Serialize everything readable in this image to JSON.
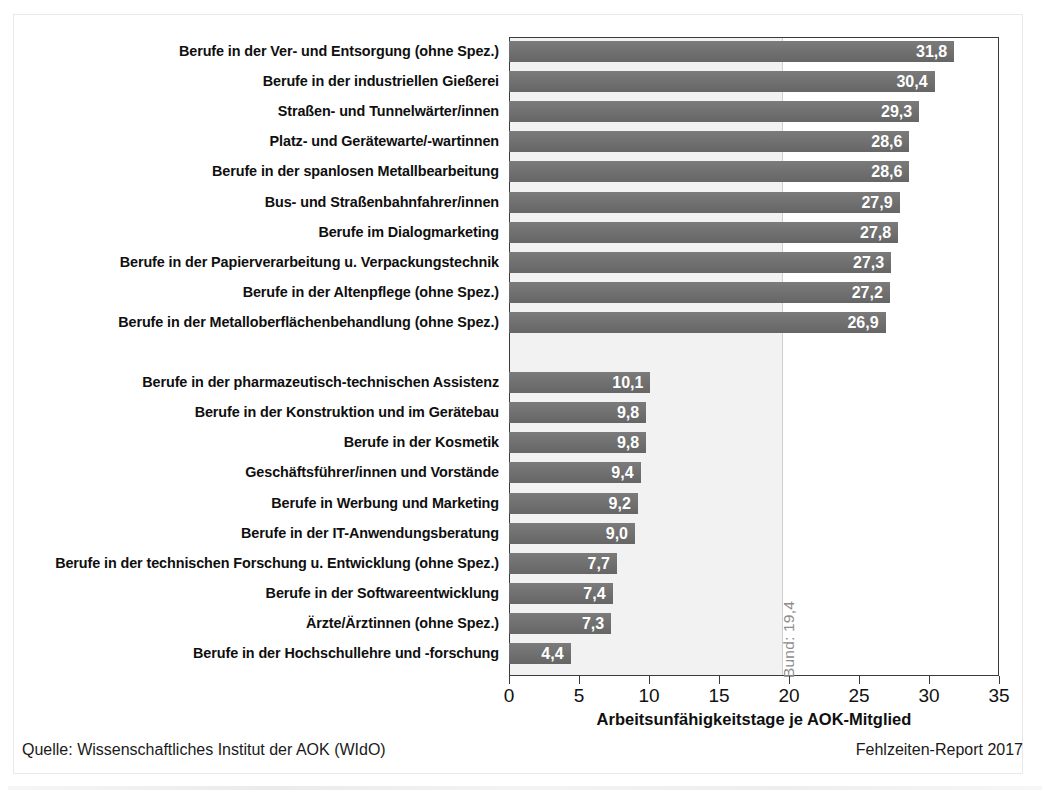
{
  "chart_data": {
    "type": "bar",
    "orientation": "horizontal",
    "title": "",
    "xlabel": "Arbeitsunfähigkeitstage je AOK-Mitglied",
    "ylabel": "",
    "xlim": [
      0,
      35
    ],
    "xticks": [
      0,
      5,
      10,
      15,
      20,
      25,
      30,
      35
    ],
    "xtick_labels": [
      "0",
      "5",
      "10",
      "15",
      "20",
      "25",
      "30",
      "35"
    ],
    "grid": false,
    "legend": null,
    "value_format": "comma-decimal",
    "groups": [
      {
        "name": "hoechste",
        "categories": [
          "Berufe in der Ver- und Entsorgung (ohne Spez.)",
          "Berufe in der industriellen Gießerei",
          "Straßen- und Tunnelwärter/innen",
          "Platz- und Gerätewarte/-wartinnen",
          "Berufe in der spanlosen Metallbearbeitung",
          "Bus- und Straßenbahnfahrer/innen",
          "Berufe im Dialogmarketing",
          "Berufe in der Papierverarbeitung u. Verpackungstechnik",
          "Berufe in der Altenpflege (ohne Spez.)",
          "Berufe in der Metalloberflächenbehandlung (ohne Spez.)"
        ],
        "values": [
          31.8,
          30.4,
          29.3,
          28.6,
          28.6,
          27.9,
          27.8,
          27.3,
          27.2,
          26.9
        ],
        "value_labels": [
          "31,8",
          "30,4",
          "29,3",
          "28,6",
          "28,6",
          "27,9",
          "27,8",
          "27,3",
          "27,2",
          "26,9"
        ]
      },
      {
        "name": "niedrigste",
        "categories": [
          "Berufe in der pharmazeutisch-technischen Assistenz",
          "Berufe in der Konstruktion und im Gerätebau",
          "Berufe in der Kosmetik",
          "Geschäftsführer/innen und Vorstände",
          "Berufe in Werbung und Marketing",
          "Berufe in der IT-Anwendungsberatung",
          "Berufe in der technischen Forschung u. Entwicklung (ohne Spez.)",
          "Berufe in der Softwareentwicklung",
          "Ärzte/Ärztinnen (ohne Spez.)",
          "Berufe in der Hochschullehre und -forschung"
        ],
        "values": [
          10.1,
          9.8,
          9.8,
          9.4,
          9.2,
          9.0,
          7.7,
          7.4,
          7.3,
          4.4
        ],
        "value_labels": [
          "10,1",
          "9,8",
          "9,8",
          "9,4",
          "9,2",
          "9,0",
          "7,7",
          "7,4",
          "7,3",
          "4,4"
        ]
      }
    ],
    "reference_line": {
      "label": "Bund: 19,4",
      "value": 19.4
    },
    "colors": {
      "bar": "#6c6c6c",
      "value_text": "#ffffff",
      "reference_shade": "#f2f2f2",
      "reference_line": "#cfcfcf",
      "axis": "#3b3b3b"
    }
  },
  "footer": {
    "source": "Quelle: Wissenschaftliches Institut der AOK (WIdO)",
    "report": "Fehlzeiten-Report 2017"
  }
}
